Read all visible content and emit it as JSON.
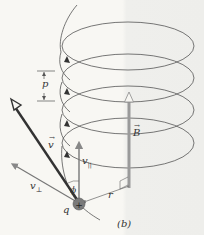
{
  "figure": {
    "panel_label": "(b)",
    "labels": {
      "pitch": "p",
      "velocity": "v",
      "v_parallel": "v",
      "v_parallel_sub": "||",
      "v_perp": "v",
      "v_perp_sub": "⊥",
      "angle": "ϕ",
      "charge": "q",
      "charge_sign": "+",
      "radius": "r",
      "field": "B"
    },
    "colors": {
      "helix": "#555555",
      "velocity": "#333333",
      "components": "#777777",
      "field": "#9a9a9a",
      "charge": "#666666",
      "background": "#f7f6f2"
    }
  }
}
